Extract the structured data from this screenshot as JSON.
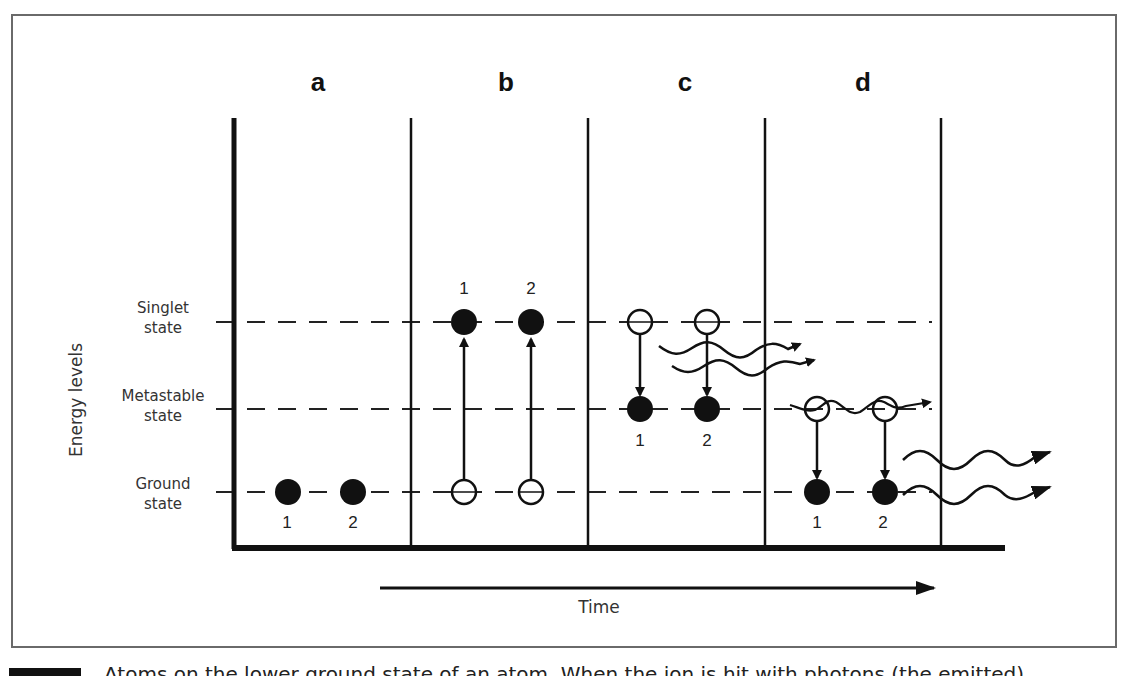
{
  "diagram": {
    "panels": [
      {
        "id": "a",
        "label": "a"
      },
      {
        "id": "b",
        "label": "b"
      },
      {
        "id": "c",
        "label": "c"
      },
      {
        "id": "d",
        "label": "d"
      }
    ],
    "y_axis_label": "Energy levels",
    "x_axis_label": "Time",
    "levels": [
      {
        "id": "singlet",
        "line1": "Singlet",
        "line2": "state"
      },
      {
        "id": "metastable",
        "line1": "Metastable",
        "line2": "state"
      },
      {
        "id": "ground",
        "line1": "Ground",
        "line2": "state"
      }
    ],
    "electron_labels": {
      "one": "1",
      "two": "2"
    }
  },
  "caption": {
    "text": "Atoms on the lower ground state of an atom. When the ion is hit with photons (the emitted)..."
  }
}
